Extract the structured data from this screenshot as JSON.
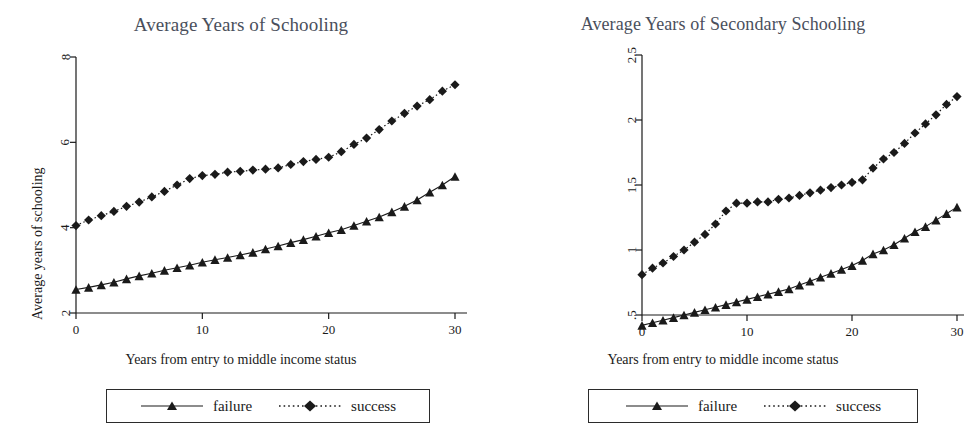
{
  "figure": {
    "background": "#ffffff",
    "series_color": "#1a1a1a",
    "title_color": "#4a4f5c"
  },
  "panels": [
    {
      "id": "left",
      "title": "Average Years of Schooling",
      "ylabel": "Average years of schooling",
      "xlabel": "Years from entry to middle income status",
      "yticks": [
        "2",
        "4",
        "6",
        "8"
      ],
      "xticks": [
        "0",
        "10",
        "20",
        "30"
      ],
      "legend": [
        {
          "key": "triangle-solid-line",
          "label": "failure"
        },
        {
          "key": "diamond-dotted-line",
          "label": "success"
        }
      ]
    },
    {
      "id": "right",
      "title": "Average Years of Secondary Schooling",
      "ylabel": "Average years of secondary schooling",
      "xlabel": "Years from entry to middle income status",
      "yticks": [
        ".5",
        "1",
        "1.5",
        "2",
        "2.5"
      ],
      "xticks": [
        "0",
        "10",
        "20",
        "30"
      ],
      "legend": [
        {
          "key": "triangle-solid-line",
          "label": "failure"
        },
        {
          "key": "diamond-dotted-line",
          "label": "success"
        }
      ]
    }
  ],
  "chart_data": [
    {
      "type": "line",
      "title": "Average Years of Schooling",
      "xlabel": "Years from entry to middle income status",
      "ylabel": "Average years of schooling",
      "xlim": [
        0,
        30
      ],
      "ylim": [
        2,
        8
      ],
      "xticks": [
        0,
        10,
        20,
        30
      ],
      "yticks": [
        2,
        4,
        6,
        8
      ],
      "grid": false,
      "legend_position": "below",
      "x": [
        0,
        1,
        2,
        3,
        4,
        5,
        6,
        7,
        8,
        9,
        10,
        11,
        12,
        13,
        14,
        15,
        16,
        17,
        18,
        19,
        20,
        21,
        22,
        23,
        24,
        25,
        26,
        27,
        28,
        29,
        30
      ],
      "series": [
        {
          "name": "failure",
          "marker": "triangle",
          "linestyle": "solid",
          "values": [
            2.55,
            2.6,
            2.66,
            2.72,
            2.8,
            2.87,
            2.93,
            3.0,
            3.06,
            3.12,
            3.19,
            3.25,
            3.3,
            3.36,
            3.42,
            3.5,
            3.57,
            3.65,
            3.72,
            3.8,
            3.88,
            3.95,
            4.05,
            4.15,
            4.25,
            4.37,
            4.5,
            4.65,
            4.83,
            5.0,
            5.2
          ]
        },
        {
          "name": "success",
          "marker": "diamond",
          "linestyle": "dotted",
          "values": [
            4.05,
            4.18,
            4.28,
            4.38,
            4.5,
            4.6,
            4.72,
            4.85,
            5.0,
            5.15,
            5.22,
            5.25,
            5.3,
            5.32,
            5.35,
            5.37,
            5.4,
            5.48,
            5.55,
            5.6,
            5.65,
            5.78,
            5.95,
            6.1,
            6.3,
            6.5,
            6.68,
            6.85,
            7.0,
            7.2,
            7.35
          ]
        }
      ]
    },
    {
      "type": "line",
      "title": "Average Years of Secondary Schooling",
      "xlabel": "Years from entry to middle income status",
      "ylabel": "Average years of secondary schooling",
      "xlim": [
        0,
        30
      ],
      "ylim": [
        0.5,
        2.5
      ],
      "xticks": [
        0,
        10,
        20,
        30
      ],
      "yticks": [
        0.5,
        1,
        1.5,
        2,
        2.5
      ],
      "grid": false,
      "legend_position": "below",
      "x": [
        0,
        1,
        2,
        3,
        4,
        5,
        6,
        7,
        8,
        9,
        10,
        11,
        12,
        13,
        14,
        15,
        16,
        17,
        18,
        19,
        20,
        21,
        22,
        23,
        24,
        25,
        26,
        27,
        28,
        29,
        30
      ],
      "series": [
        {
          "name": "failure",
          "marker": "triangle",
          "linestyle": "solid",
          "values": [
            0.42,
            0.44,
            0.46,
            0.48,
            0.5,
            0.52,
            0.54,
            0.56,
            0.58,
            0.6,
            0.62,
            0.64,
            0.66,
            0.68,
            0.7,
            0.73,
            0.76,
            0.79,
            0.82,
            0.85,
            0.88,
            0.92,
            0.97,
            1.0,
            1.04,
            1.09,
            1.14,
            1.18,
            1.23,
            1.28,
            1.33
          ]
        },
        {
          "name": "success",
          "marker": "diamond",
          "linestyle": "dotted",
          "values": [
            0.81,
            0.86,
            0.9,
            0.95,
            1.0,
            1.06,
            1.12,
            1.2,
            1.3,
            1.36,
            1.36,
            1.37,
            1.37,
            1.39,
            1.4,
            1.42,
            1.44,
            1.46,
            1.48,
            1.5,
            1.52,
            1.54,
            1.63,
            1.7,
            1.75,
            1.82,
            1.9,
            1.97,
            2.04,
            2.12,
            2.18
          ]
        }
      ]
    }
  ]
}
